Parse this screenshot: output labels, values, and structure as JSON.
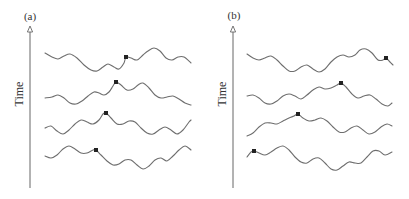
{
  "colors": {
    "wave": "#6e6e6e",
    "axis": "#666666",
    "marker": "#222222",
    "text": "#333333"
  },
  "panels": [
    {
      "label": "(a)",
      "axis_label": "Time",
      "axis_x": 30,
      "axis_top": 27,
      "axis_bottom": 188,
      "label_x": 30,
      "label_y": 20,
      "axis_label_x": 27,
      "axis_label_y": 98,
      "rows": [
        {
          "points": [
            [
              45,
              53
            ],
            [
              52,
              57
            ],
            [
              58,
              59
            ],
            [
              64,
              56
            ],
            [
              70,
              54
            ],
            [
              77,
              58
            ],
            [
              84,
              65
            ],
            [
              91,
              70
            ],
            [
              97,
              71
            ],
            [
              103,
              67
            ],
            [
              108,
              64
            ],
            [
              114,
              67
            ],
            [
              119,
              69
            ],
            [
              124,
              63
            ],
            [
              126,
              57
            ],
            [
              131,
              58
            ],
            [
              137,
              60
            ],
            [
              143,
              55
            ],
            [
              148,
              51
            ],
            [
              154,
              48
            ],
            [
              160,
              51
            ],
            [
              166,
              58
            ],
            [
              172,
              60
            ],
            [
              178,
              57
            ],
            [
              184,
              57
            ],
            [
              191,
              63
            ]
          ],
          "marker": [
            126,
            57
          ]
        },
        {
          "points": [
            [
              45,
              98
            ],
            [
              52,
              97
            ],
            [
              58,
              95
            ],
            [
              64,
              98
            ],
            [
              70,
              103
            ],
            [
              76,
              104
            ],
            [
              82,
              101
            ],
            [
              88,
              96
            ],
            [
              94,
              92
            ],
            [
              99,
              93
            ],
            [
              104,
              95
            ],
            [
              109,
              92
            ],
            [
              113,
              86
            ],
            [
              116,
              82
            ],
            [
              121,
              85
            ],
            [
              127,
              90
            ],
            [
              133,
              89
            ],
            [
              138,
              85
            ],
            [
              143,
              83
            ],
            [
              149,
              88
            ],
            [
              155,
              95
            ],
            [
              161,
              98
            ],
            [
              167,
              97
            ],
            [
              173,
              96
            ],
            [
              179,
              99
            ],
            [
              185,
              103
            ],
            [
              191,
              105
            ]
          ],
          "marker": [
            116,
            82
          ]
        },
        {
          "points": [
            [
              45,
              128
            ],
            [
              51,
              126
            ],
            [
              57,
              131
            ],
            [
              63,
              134
            ],
            [
              69,
              130
            ],
            [
              75,
              124
            ],
            [
              81,
              120
            ],
            [
              87,
              122
            ],
            [
              93,
              124
            ],
            [
              99,
              120
            ],
            [
              103,
              114
            ],
            [
              106,
              113
            ],
            [
              111,
              118
            ],
            [
              117,
              124
            ],
            [
              123,
              124
            ],
            [
              129,
              121
            ],
            [
              135,
              122
            ],
            [
              141,
              128
            ],
            [
              147,
              133
            ],
            [
              153,
              134
            ],
            [
              159,
              130
            ],
            [
              165,
              127
            ],
            [
              171,
              130
            ],
            [
              177,
              134
            ],
            [
              183,
              130
            ],
            [
              189,
              122
            ],
            [
              191,
              120
            ]
          ],
          "marker": [
            106,
            113
          ]
        },
        {
          "points": [
            [
              45,
              156
            ],
            [
              51,
              158
            ],
            [
              57,
              155
            ],
            [
              63,
              149
            ],
            [
              69,
              146
            ],
            [
              75,
              149
            ],
            [
              81,
              153
            ],
            [
              87,
              153
            ],
            [
              93,
              150
            ],
            [
              96,
              150
            ],
            [
              101,
              155
            ],
            [
              107,
              161
            ],
            [
              113,
              165
            ],
            [
              119,
              164
            ],
            [
              125,
              160
            ],
            [
              131,
              160
            ],
            [
              137,
              165
            ],
            [
              143,
              169
            ],
            [
              149,
              166
            ],
            [
              155,
              160
            ],
            [
              161,
              158
            ],
            [
              167,
              161
            ],
            [
              173,
              156
            ],
            [
              179,
              150
            ],
            [
              185,
              146
            ],
            [
              191,
              150
            ]
          ],
          "marker": [
            96,
            150
          ]
        }
      ]
    },
    {
      "label": "(b)",
      "axis_label": "Time",
      "axis_x": 233,
      "axis_top": 27,
      "axis_bottom": 188,
      "label_x": 234,
      "label_y": 19,
      "axis_label_x": 230,
      "axis_label_y": 98,
      "rows": [
        {
          "points": [
            [
              247,
              54
            ],
            [
              253,
              58
            ],
            [
              259,
              60
            ],
            [
              265,
              58
            ],
            [
              271,
              56
            ],
            [
              277,
              60
            ],
            [
              283,
              66
            ],
            [
              289,
              71
            ],
            [
              295,
              71
            ],
            [
              301,
              67
            ],
            [
              307,
              65
            ],
            [
              313,
              69
            ],
            [
              319,
              72
            ],
            [
              325,
              69
            ],
            [
              331,
              62
            ],
            [
              337,
              57
            ],
            [
              343,
              55
            ],
            [
              349,
              57
            ],
            [
              355,
              55
            ],
            [
              360,
              50
            ],
            [
              366,
              49
            ],
            [
              372,
              53
            ],
            [
              378,
              60
            ],
            [
              383,
              60
            ],
            [
              386,
              58
            ],
            [
              390,
              62
            ],
            [
              393,
              65
            ]
          ],
          "marker": [
            386,
            58
          ]
        },
        {
          "points": [
            [
              247,
              96
            ],
            [
              253,
              95
            ],
            [
              259,
              98
            ],
            [
              265,
              103
            ],
            [
              271,
              104
            ],
            [
              277,
              101
            ],
            [
              283,
              96
            ],
            [
              289,
              94
            ],
            [
              295,
              96
            ],
            [
              301,
              99
            ],
            [
              307,
              95
            ],
            [
              313,
              90
            ],
            [
              319,
              87
            ],
            [
              325,
              89
            ],
            [
              331,
              88
            ],
            [
              337,
              85
            ],
            [
              341,
              83
            ],
            [
              346,
              87
            ],
            [
              352,
              94
            ],
            [
              358,
              98
            ],
            [
              364,
              96
            ],
            [
              370,
              95
            ],
            [
              376,
              99
            ],
            [
              382,
              104
            ],
            [
              388,
              106
            ],
            [
              392,
              103
            ]
          ],
          "marker": [
            341,
            83
          ]
        },
        {
          "points": [
            [
              247,
              136
            ],
            [
              253,
              133
            ],
            [
              259,
              127
            ],
            [
              265,
              123
            ],
            [
              271,
              123
            ],
            [
              277,
              124
            ],
            [
              283,
              121
            ],
            [
              289,
              118
            ],
            [
              294,
              116
            ],
            [
              298,
              114
            ],
            [
              303,
              118
            ],
            [
              309,
              121
            ],
            [
              315,
              120
            ],
            [
              321,
              118
            ],
            [
              327,
              121
            ],
            [
              333,
              127
            ],
            [
              339,
              132
            ],
            [
              345,
              132
            ],
            [
              351,
              128
            ],
            [
              357,
              126
            ],
            [
              363,
              130
            ],
            [
              369,
              134
            ],
            [
              375,
              132
            ],
            [
              381,
              127
            ],
            [
              387,
              124
            ],
            [
              392,
              126
            ]
          ],
          "marker": [
            298,
            114
          ]
        },
        {
          "points": [
            [
              247,
              157
            ],
            [
              251,
              152
            ],
            [
              254,
              151
            ],
            [
              259,
              153
            ],
            [
              265,
              155
            ],
            [
              271,
              152
            ],
            [
              277,
              148
            ],
            [
              283,
              146
            ],
            [
              289,
              150
            ],
            [
              295,
              157
            ],
            [
              301,
              162
            ],
            [
              307,
              163
            ],
            [
              313,
              159
            ],
            [
              319,
              158
            ],
            [
              325,
              163
            ],
            [
              331,
              169
            ],
            [
              337,
              170
            ],
            [
              343,
              166
            ],
            [
              349,
              162
            ],
            [
              355,
              163
            ],
            [
              361,
              163
            ],
            [
              367,
              157
            ],
            [
              373,
              151
            ],
            [
              379,
              151
            ],
            [
              385,
              155
            ],
            [
              392,
              152
            ]
          ],
          "marker": [
            254,
            151
          ]
        }
      ]
    }
  ]
}
